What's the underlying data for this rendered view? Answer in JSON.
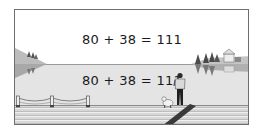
{
  "illustration": {
    "equation_above": "80 + 38 = 111",
    "equation_reflection": "80 + 38 = 111",
    "scene": {
      "elements": [
        "left-shore-with-trees",
        "right-shore-with-trees-and-house",
        "lake-water",
        "wooden-dock",
        "rope-railing",
        "standing-person",
        "dog",
        "shadow"
      ]
    },
    "colors": {
      "frame_border": "#6e6e6e",
      "sky": "#ffffff",
      "water": "#e4e4e4",
      "text": "#1a1a1a"
    }
  }
}
